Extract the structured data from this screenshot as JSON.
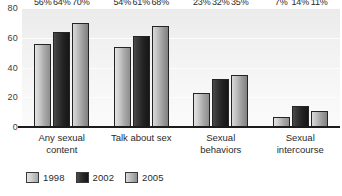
{
  "chart_data": {
    "type": "bar",
    "title": "",
    "subtitle": "",
    "xlabel": "",
    "ylabel": "",
    "ylim": [
      0,
      80
    ],
    "yticks": [
      0,
      20,
      40,
      60,
      80
    ],
    "grid": true,
    "legend_position": "bottom-left",
    "categories": [
      "Any sexual content",
      "Talk about sex",
      "Sexual behaviors",
      "Sexual intercourse"
    ],
    "category_lines": [
      [
        "Any sexual",
        "content"
      ],
      [
        "Talk about sex",
        ""
      ],
      [
        "Sexual",
        "behaviors"
      ],
      [
        "Sexual",
        "intercourse"
      ]
    ],
    "series": [
      {
        "name": "1998",
        "color": "#cfcfcf",
        "values": [
          56,
          54,
          23,
          7
        ],
        "labels": [
          "56%",
          "54%",
          "23%",
          "7%"
        ]
      },
      {
        "name": "2002",
        "color": "#232323",
        "values": [
          64,
          61,
          32,
          14
        ],
        "labels": [
          "64%",
          "61%",
          "32%",
          "14%"
        ]
      },
      {
        "name": "2005",
        "color": "#9d9d9d",
        "values": [
          70,
          68,
          35,
          11
        ],
        "labels": [
          "70%",
          "68%",
          "35%",
          "11%"
        ]
      }
    ]
  },
  "axis": {
    "y_tick_labels": [
      "80",
      "60",
      "40",
      "20",
      "0"
    ]
  },
  "legend": {
    "items": [
      {
        "label": "1998"
      },
      {
        "label": "2002"
      },
      {
        "label": "2005"
      }
    ]
  },
  "colors": {
    "plot_background": "#f2f2f2",
    "axis_line": "#1c1c1c",
    "gridline": "#fdfdfd",
    "text": "#2a2a2a"
  }
}
